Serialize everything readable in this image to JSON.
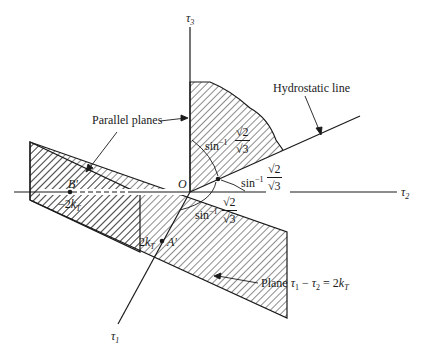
{
  "diagram": {
    "type": "3D stress space (Tresca yield) schematic",
    "axes": {
      "tau1": {
        "symbol": "τ",
        "sub": "1"
      },
      "tau2": {
        "symbol": "τ",
        "sub": "2"
      },
      "tau3": {
        "symbol": "τ",
        "sub": "3"
      },
      "origin": "O"
    },
    "labels": {
      "parallel_planes": "Parallel planes",
      "hydrostatic_line": "Hydrostatic line",
      "plane_prefix": "Plane ",
      "plane_eq_t1": "τ",
      "plane_eq_s1": "1",
      "plane_eq_mid": " − ",
      "plane_eq_t2": "τ",
      "plane_eq_s2": "2",
      "plane_eq_rhs": " = 2",
      "plane_eq_k": "k",
      "plane_eq_ksub": "T"
    },
    "points": {
      "B": {
        "name": "B'",
        "value_prefix": "−2",
        "value_k": "k",
        "value_sub": "T"
      },
      "A": {
        "name": "A'",
        "value_prefix": "2",
        "value_k": "k",
        "value_sub": "T"
      }
    },
    "angles": [
      {
        "func": "sin",
        "exp": "−1",
        "num": "√2",
        "den": "√3"
      },
      {
        "func": "sin",
        "exp": "−1",
        "num": "√2",
        "den": "√3"
      },
      {
        "func": "sin",
        "exp": "−1",
        "num": "√2",
        "den": "√3"
      }
    ],
    "colors": {
      "ink": "#1a1a1a",
      "background": "#ffffff"
    }
  }
}
